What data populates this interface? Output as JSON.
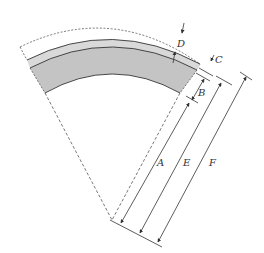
{
  "diagram": {
    "type": "sector-cross-section",
    "colors": {
      "background": "#ffffff",
      "stroke": "#444444",
      "band_fill": "#c4c4c4",
      "coating_fill": "#d9d9d9",
      "dashed": "#555555"
    },
    "labels": {
      "A": "A",
      "B": "B",
      "C": "C",
      "D": "D",
      "E": "E",
      "F": "F"
    }
  }
}
